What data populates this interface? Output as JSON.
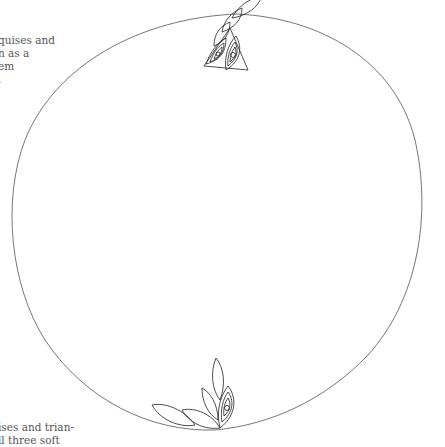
{
  "page": {
    "top_paragraph": {
      "lines": [
        "quises and",
        "n as a",
        "em",
        "."
      ]
    },
    "bottom_paragraph": {
      "lines": [
        "ises and trian-",
        "ll three soft"
      ]
    }
  },
  "figure": {
    "stroke_color": "#555555",
    "motif_color": "#222222",
    "background": "#ffffff"
  }
}
